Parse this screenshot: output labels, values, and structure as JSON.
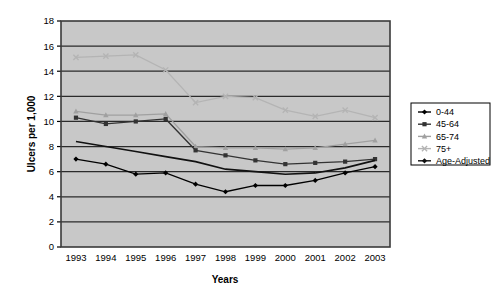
{
  "chart_data": {
    "type": "line",
    "title": "",
    "xlabel": "Years",
    "ylabel": "Ulcers per 1,000",
    "x": [
      1993,
      1994,
      1995,
      1996,
      1997,
      1998,
      1999,
      2000,
      2001,
      2002,
      2003
    ],
    "categories": [
      "1993",
      "1994",
      "1995",
      "1996",
      "1997",
      "1998",
      "1999",
      "2000",
      "2001",
      "2002",
      "2003"
    ],
    "ylim": [
      0,
      18
    ],
    "ytick_step": 2,
    "yticks": [
      "0",
      "2",
      "4",
      "6",
      "8",
      "10",
      "12",
      "14",
      "16",
      "18"
    ],
    "grid": "horizontal",
    "legend_position": "right",
    "plot_background": "#c8c8c8",
    "series": [
      {
        "name": "0-44",
        "marker": "diamond",
        "color": "#000000",
        "values": [
          7.0,
          6.6,
          5.8,
          5.9,
          5.0,
          4.4,
          4.9,
          4.9,
          5.3,
          5.9,
          6.4
        ]
      },
      {
        "name": "45-64",
        "marker": "square",
        "color": "#333333",
        "values": [
          10.3,
          9.8,
          10.0,
          10.2,
          7.7,
          7.3,
          6.9,
          6.6,
          6.7,
          6.8,
          7.0
        ]
      },
      {
        "name": "65-74",
        "marker": "triangle",
        "color": "#a0a0a0",
        "values": [
          10.8,
          10.5,
          10.5,
          10.6,
          8.0,
          7.9,
          7.9,
          7.8,
          7.9,
          8.2,
          8.5
        ]
      },
      {
        "name": "75+",
        "marker": "cross",
        "color": "#b4b4b4",
        "values": [
          15.1,
          15.2,
          15.3,
          14.1,
          11.5,
          12.0,
          11.9,
          10.9,
          10.4,
          10.9,
          10.3
        ]
      },
      {
        "name": "Age-Adjusted",
        "marker": "none",
        "color": "#111111",
        "values": [
          8.4,
          8.0,
          7.6,
          7.2,
          6.8,
          6.2,
          6.0,
          5.8,
          5.9,
          6.3,
          6.9
        ]
      }
    ]
  },
  "legend": {
    "items": [
      {
        "label": "0-44"
      },
      {
        "label": "45-64"
      },
      {
        "label": "65-74"
      },
      {
        "label": "75+"
      },
      {
        "label": "Age-Adjusted"
      }
    ]
  }
}
